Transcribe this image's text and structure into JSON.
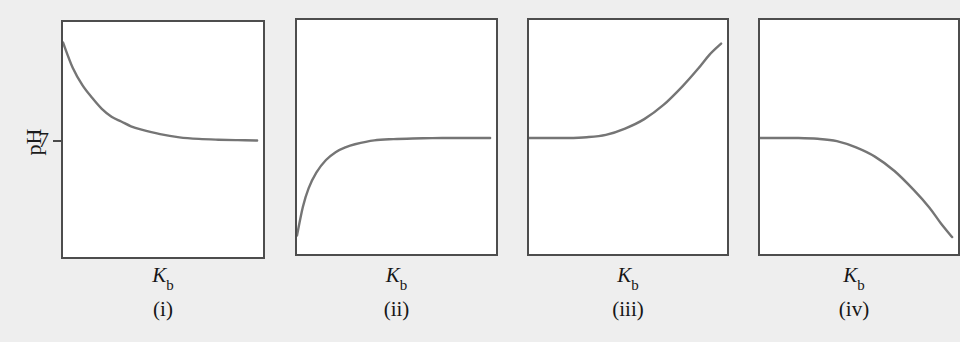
{
  "figure": {
    "background_color": "#eeeeee",
    "panel_background_color": "#ffffff",
    "panel_border_color": "#4d4d4d",
    "curve_color": "#757575",
    "y_axis_label": "pH",
    "y_tick_value": "7",
    "x_axis_symbol": "K",
    "x_axis_subscript": "b"
  },
  "chart_data": {
    "type": "line",
    "title": "",
    "xlabel": "Kb",
    "ylabel": "pH",
    "grid": false,
    "legend": "none",
    "note": "Four schematic panels of pH versus base ionization constant Kb. Only one y-axis tick is labelled, pH = 7. The y value 7 sits at the level of the flat (asymptotic or initial) portion of each curve. x axis is unlabelled other than the symbol Kb; no numeric ticks are drawn.",
    "ylim": [
      0,
      14
    ],
    "y_ticks": [
      7
    ],
    "panels": [
      {
        "id": "i",
        "label": "(i)",
        "xlabel": "Kb",
        "ylabel": "pH",
        "shape": "decreasing-decay-to-asymptote-7",
        "description": "pH starts high at small Kb and decays monotonically, levelling off at pH 7.",
        "x": [
          0.0,
          0.05,
          0.1,
          0.15,
          0.2,
          0.25,
          0.3,
          0.35,
          0.4,
          0.5,
          0.6,
          0.7,
          0.8,
          0.9,
          1.0
        ],
        "y": [
          13.2,
          11.6,
          10.5,
          9.7,
          9.0,
          8.5,
          8.2,
          7.9,
          7.7,
          7.4,
          7.2,
          7.1,
          7.05,
          7.02,
          7.0
        ]
      },
      {
        "id": "ii",
        "label": "(ii)",
        "xlabel": "Kb",
        "ylabel": "pH",
        "shape": "increasing-saturating-to-asymptote-7",
        "description": "pH starts low at small Kb and rises steeply, levelling off at pH 7.",
        "x": [
          0.0,
          0.03,
          0.06,
          0.1,
          0.15,
          0.2,
          0.25,
          0.3,
          0.4,
          0.5,
          0.6,
          0.7,
          0.8,
          0.9,
          1.0
        ],
        "y": [
          0.8,
          2.6,
          3.8,
          4.8,
          5.6,
          6.1,
          6.4,
          6.6,
          6.85,
          6.93,
          6.97,
          6.99,
          7.0,
          7.0,
          7.0
        ]
      },
      {
        "id": "iii",
        "label": "(iii)",
        "xlabel": "Kb",
        "ylabel": "pH",
        "shape": "flat-at-7-then-rising",
        "description": "pH stays flat at 7 for small Kb, then rises steeply at large Kb.",
        "x": [
          0.0,
          0.1,
          0.2,
          0.3,
          0.4,
          0.5,
          0.6,
          0.7,
          0.8,
          0.88,
          0.94,
          1.0
        ],
        "y": [
          7.0,
          7.0,
          7.0,
          7.05,
          7.2,
          7.6,
          8.2,
          9.1,
          10.3,
          11.4,
          12.3,
          13.0
        ]
      },
      {
        "id": "iv",
        "label": "(iv)",
        "xlabel": "Kb",
        "ylabel": "pH",
        "shape": "flat-at-7-then-falling",
        "description": "pH stays flat at 7 for small Kb, then falls steeply at large Kb.",
        "x": [
          0.0,
          0.1,
          0.2,
          0.3,
          0.4,
          0.5,
          0.6,
          0.7,
          0.8,
          0.88,
          0.94,
          1.0
        ],
        "y": [
          7.0,
          7.0,
          7.0,
          6.95,
          6.8,
          6.4,
          5.8,
          4.9,
          3.7,
          2.6,
          1.6,
          0.7
        ]
      }
    ]
  },
  "panels": [
    {
      "label": "(i)",
      "axis_symbol": "K",
      "axis_subscript": "b"
    },
    {
      "label": "(ii)",
      "axis_symbol": "K",
      "axis_subscript": "b"
    },
    {
      "label": "(iii)",
      "axis_symbol": "K",
      "axis_subscript": "b"
    },
    {
      "label": "(iv)",
      "axis_symbol": "K",
      "axis_subscript": "b"
    }
  ]
}
